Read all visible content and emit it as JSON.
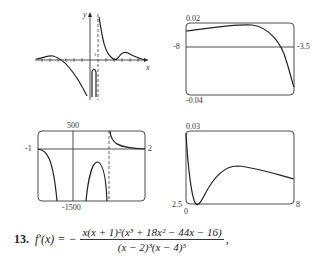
{
  "graphs": [
    {
      "id": "sketch",
      "x_axis_label": "x",
      "y_axis_label": "y",
      "tick_label": "1"
    },
    {
      "id": "window1",
      "y_max": "0.02",
      "y_min": "-0.04",
      "x_min": "-8",
      "x_max": "-3.5"
    },
    {
      "id": "window2",
      "y_max": "500",
      "y_min": "-1500",
      "x_min": "-1",
      "x_max": "2"
    },
    {
      "id": "window3",
      "y_max": "0.03",
      "y_min": "2.5",
      "x_min": "0",
      "x_max": "8"
    }
  ],
  "exercise": {
    "number": "13.",
    "lhs": "f′(x) = −",
    "numerator": "x(x + 1)²(x³ + 18x² − 44x − 16)",
    "denominator": "(x − 2)³(x − 4)⁵",
    "trailing": ","
  }
}
